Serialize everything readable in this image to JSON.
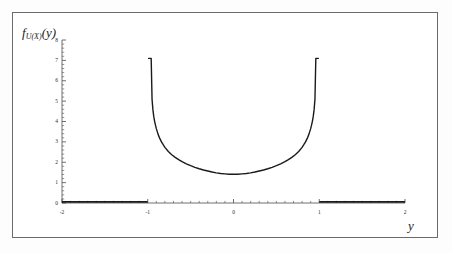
{
  "figure": {
    "ylabel_main": "f",
    "ylabel_sub": "U(X)",
    "ylabel_arg": "(y)",
    "xlabel": "y",
    "border_color": "#6b6b6b",
    "curve_color": "#1a1a1a",
    "axis_color": "#4d4d4d",
    "background": "#ffffff"
  },
  "chart_data": {
    "type": "line",
    "title": "",
    "xlabel": "y",
    "ylabel": "f_U(X)(y)",
    "xlim": [
      -2,
      2
    ],
    "ylim": [
      0,
      8
    ],
    "grid": false,
    "legend": null,
    "xticks": [
      -2,
      -1,
      0,
      1,
      2
    ],
    "xtick_labels": [
      "-2",
      "-1",
      "0",
      "1",
      "2"
    ],
    "yticks": [
      0,
      1,
      2,
      3,
      4,
      5,
      6,
      7,
      8
    ],
    "ytick_labels": [
      "0",
      "1",
      "2",
      "3",
      "4",
      "5",
      "6",
      "7",
      "8"
    ],
    "x_minor_tick_step": 0.1,
    "y_minor_tick_step": 0.2,
    "annotations": [
      "density supported on (-1, 1)",
      "vertical asymptotes at y = -1 and y = 1",
      "value clipped at approximately 7.1 at the spikes",
      "minimum value approximately 0.5 at y = 0",
      "zero outside the interval [-1, 1]"
    ],
    "series": [
      {
        "name": "f_U(X)(y)",
        "color": "#1a1a1a",
        "linewidth": 1.4,
        "x": [
          -2.0,
          -1.9,
          -1.8,
          -1.7,
          -1.6,
          -1.5,
          -1.4,
          -1.3,
          -1.2,
          -1.1,
          -1.0,
          -0.99,
          -0.98,
          -0.97,
          -0.96,
          -0.95,
          -0.94,
          -0.93,
          -0.92,
          -0.91,
          -0.9,
          -0.88,
          -0.86,
          -0.84,
          -0.82,
          -0.8,
          -0.76,
          -0.72,
          -0.68,
          -0.64,
          -0.6,
          -0.55,
          -0.5,
          -0.45,
          -0.4,
          -0.35,
          -0.3,
          -0.25,
          -0.2,
          -0.15,
          -0.1,
          -0.05,
          0.0,
          0.05,
          0.1,
          0.15,
          0.2,
          0.25,
          0.3,
          0.35,
          0.4,
          0.45,
          0.5,
          0.55,
          0.6,
          0.64,
          0.68,
          0.72,
          0.76,
          0.8,
          0.82,
          0.84,
          0.86,
          0.88,
          0.9,
          0.91,
          0.92,
          0.93,
          0.94,
          0.95,
          0.96,
          0.97,
          0.98,
          0.99,
          1.0,
          1.1,
          1.2,
          1.3,
          1.4,
          1.5,
          1.6,
          1.7,
          1.8,
          1.9,
          2.0
        ],
        "y": [
          0,
          0,
          0,
          0,
          0,
          0,
          0,
          0,
          0,
          0,
          0,
          7.1,
          7.1,
          7.1,
          7.1,
          5.1,
          4.58,
          4.25,
          4.01,
          3.82,
          3.65,
          3.38,
          3.17,
          3.0,
          2.86,
          2.73,
          2.53,
          2.37,
          2.24,
          2.13,
          2.03,
          1.92,
          1.83,
          1.75,
          1.68,
          1.62,
          1.57,
          1.52,
          1.48,
          1.45,
          1.43,
          1.41,
          1.41,
          1.41,
          1.43,
          1.45,
          1.48,
          1.52,
          1.57,
          1.62,
          1.68,
          1.75,
          1.83,
          1.92,
          2.03,
          2.13,
          2.24,
          2.37,
          2.53,
          2.73,
          2.86,
          3.0,
          3.17,
          3.38,
          3.65,
          3.82,
          4.01,
          4.25,
          4.58,
          5.1,
          7.1,
          7.1,
          7.1,
          7.1,
          0,
          0,
          0,
          0,
          0,
          0,
          0,
          0,
          0,
          0,
          0
        ],
        "y_display_note": "plotted values scaled so minimum reads about 0.5 and spikes clip at about 7.1"
      }
    ]
  }
}
